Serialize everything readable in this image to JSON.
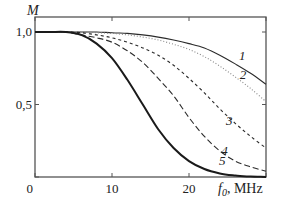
{
  "chart_data": {
    "type": "line",
    "title": "",
    "xlabel": "f0, MHz",
    "xlabel_parts": {
      "symbol": "f",
      "subscript": "0",
      "unit": ", MHz"
    },
    "ylabel": "M",
    "xlim": [
      0,
      30
    ],
    "ylim": [
      0,
      1.0
    ],
    "x_ticks": [
      0,
      10,
      20,
      30
    ],
    "x_tick_labels": [
      "0",
      "10",
      "20"
    ],
    "y_ticks": [
      0,
      0.5,
      1.0
    ],
    "y_tick_labels": [
      "",
      "0,5",
      "1,0"
    ],
    "grid": false,
    "legend": "inline curve labels",
    "x": [
      0,
      2,
      4,
      6,
      8,
      10,
      12,
      14,
      16,
      18,
      20,
      22,
      24,
      26,
      28,
      30
    ],
    "series": [
      {
        "name": "1",
        "style": "solid-thin",
        "values": [
          1.0,
          1.0,
          1.0,
          1.0,
          1.0,
          0.995,
          0.99,
          0.98,
          0.965,
          0.945,
          0.92,
          0.89,
          0.84,
          0.78,
          0.715,
          0.64
        ]
      },
      {
        "name": "2",
        "style": "dotted",
        "values": [
          1.0,
          1.0,
          1.0,
          1.0,
          0.995,
          0.99,
          0.98,
          0.965,
          0.945,
          0.915,
          0.88,
          0.83,
          0.765,
          0.69,
          0.61,
          0.52
        ]
      },
      {
        "name": "3",
        "style": "dashed",
        "values": [
          1.0,
          1.0,
          1.0,
          0.995,
          0.98,
          0.96,
          0.93,
          0.89,
          0.84,
          0.77,
          0.68,
          0.58,
          0.47,
          0.37,
          0.28,
          0.2
        ]
      },
      {
        "name": "4",
        "style": "long-dashed",
        "values": [
          1.0,
          1.0,
          1.0,
          0.98,
          0.96,
          0.93,
          0.87,
          0.79,
          0.68,
          0.56,
          0.41,
          0.28,
          0.18,
          0.11,
          0.07,
          0.04
        ]
      },
      {
        "name": "5",
        "style": "solid-thick",
        "values": [
          1.0,
          1.0,
          1.0,
          0.98,
          0.92,
          0.82,
          0.67,
          0.5,
          0.33,
          0.2,
          0.11,
          0.055,
          0.025,
          0.01,
          0.003,
          0.0
        ]
      }
    ],
    "curve_labels": [
      {
        "text": "1",
        "x": 26.5,
        "y": 0.81
      },
      {
        "text": "2",
        "x": 26.6,
        "y": 0.675
      },
      {
        "text": "3",
        "x": 24.8,
        "y": 0.36
      },
      {
        "text": "4",
        "x": 24.2,
        "y": 0.155
      },
      {
        "text": "5",
        "x": 23.9,
        "y": 0.085
      }
    ]
  },
  "colors": {
    "line": "#2b2b2b",
    "frame": "#555555",
    "dotted": "#888888"
  }
}
